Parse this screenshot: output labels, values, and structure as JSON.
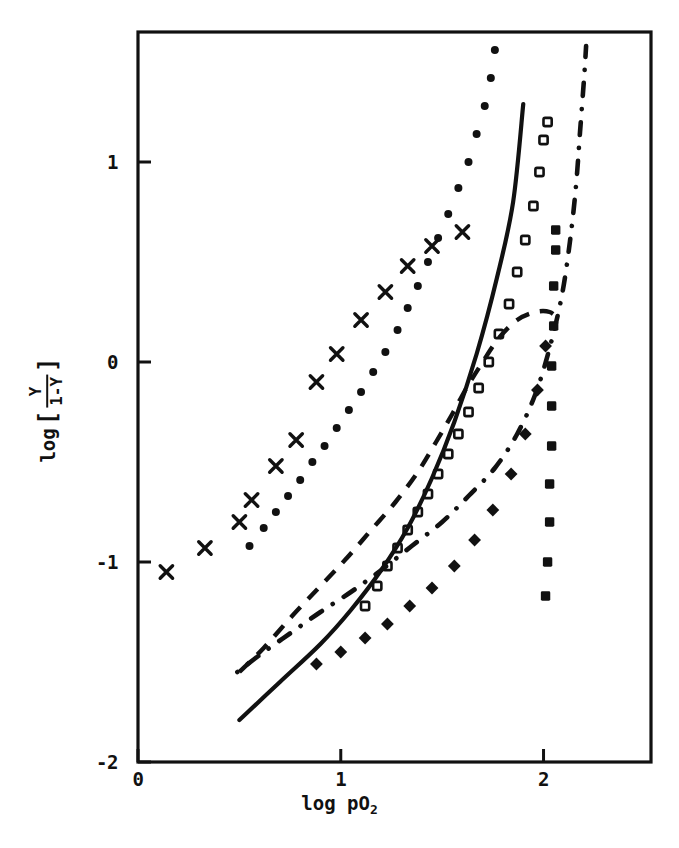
{
  "chart_data": {
    "type": "scatter",
    "title": "",
    "subtitle": "",
    "xlabel": "log pO2",
    "xlabel_base": "log pO",
    "xlabel_sub": "2",
    "ylabel": "log [ Y / (1-Y) ]",
    "ylabel_prefix": "log",
    "ylabel_numerator": "Y",
    "ylabel_denominator": "1-Y",
    "ylabel_open_bracket": "[",
    "ylabel_close_bracket": "]",
    "xlim": [
      0,
      2.53
    ],
    "ylim": [
      -2,
      1.65
    ],
    "xticks": [
      0,
      1,
      2
    ],
    "xtick_labels": [
      "0",
      "1",
      "2"
    ],
    "yticks": [
      -2,
      -1,
      0,
      1
    ],
    "ytick_labels": [
      "-2",
      "-1",
      "0",
      "1"
    ],
    "grid": false,
    "legend": "none",
    "axis_color": "#111111",
    "series": [
      {
        "name": "x-markers",
        "marker": "x",
        "style": "markers",
        "color": "#111111",
        "points": [
          [
            0.14,
            -1.05
          ],
          [
            0.33,
            -0.93
          ],
          [
            0.5,
            -0.8
          ],
          [
            0.56,
            -0.69
          ],
          [
            0.68,
            -0.52
          ],
          [
            0.78,
            -0.39
          ],
          [
            0.88,
            -0.1
          ],
          [
            0.98,
            0.04
          ],
          [
            1.1,
            0.21
          ],
          [
            1.22,
            0.35
          ],
          [
            1.33,
            0.48
          ],
          [
            1.45,
            0.58
          ],
          [
            1.6,
            0.65
          ]
        ]
      },
      {
        "name": "dotted-filled-circles",
        "marker": "circle-filled",
        "style": "dotted-line",
        "color": "#111111",
        "points": [
          [
            0.55,
            -0.92
          ],
          [
            0.62,
            -0.83
          ],
          [
            0.68,
            -0.75
          ],
          [
            0.74,
            -0.67
          ],
          [
            0.8,
            -0.59
          ],
          [
            0.86,
            -0.5
          ],
          [
            0.92,
            -0.42
          ],
          [
            0.98,
            -0.33
          ],
          [
            1.04,
            -0.24
          ],
          [
            1.1,
            -0.15
          ],
          [
            1.16,
            -0.05
          ],
          [
            1.22,
            0.05
          ],
          [
            1.28,
            0.16
          ],
          [
            1.33,
            0.27
          ],
          [
            1.38,
            0.38
          ],
          [
            1.43,
            0.5
          ],
          [
            1.48,
            0.62
          ],
          [
            1.53,
            0.74
          ],
          [
            1.58,
            0.87
          ],
          [
            1.63,
            1.0
          ],
          [
            1.67,
            1.14
          ],
          [
            1.71,
            1.28
          ],
          [
            1.74,
            1.42
          ],
          [
            1.76,
            1.56
          ]
        ]
      },
      {
        "name": "solid-line",
        "marker": "none",
        "style": "solid-line",
        "color": "#111111",
        "points": [
          [
            0.5,
            -1.79
          ],
          [
            0.7,
            -1.6
          ],
          [
            0.9,
            -1.41
          ],
          [
            1.05,
            -1.24
          ],
          [
            1.2,
            -1.04
          ],
          [
            1.33,
            -0.83
          ],
          [
            1.45,
            -0.58
          ],
          [
            1.56,
            -0.3
          ],
          [
            1.67,
            0.04
          ],
          [
            1.77,
            0.42
          ],
          [
            1.85,
            0.8
          ],
          [
            1.9,
            1.29
          ]
        ]
      },
      {
        "name": "open-squares",
        "marker": "square-open",
        "style": "markers",
        "color": "#111111",
        "points": [
          [
            1.12,
            -1.22
          ],
          [
            1.18,
            -1.12
          ],
          [
            1.23,
            -1.02
          ],
          [
            1.28,
            -0.93
          ],
          [
            1.33,
            -0.84
          ],
          [
            1.38,
            -0.75
          ],
          [
            1.43,
            -0.66
          ],
          [
            1.48,
            -0.56
          ],
          [
            1.53,
            -0.46
          ],
          [
            1.58,
            -0.36
          ],
          [
            1.63,
            -0.25
          ],
          [
            1.68,
            -0.13
          ],
          [
            1.73,
            0.0
          ],
          [
            1.78,
            0.14
          ],
          [
            1.83,
            0.29
          ],
          [
            1.87,
            0.45
          ],
          [
            1.91,
            0.61
          ],
          [
            1.95,
            0.78
          ],
          [
            1.98,
            0.95
          ],
          [
            2.0,
            1.11
          ],
          [
            2.02,
            1.2
          ]
        ]
      },
      {
        "name": "dashed-line",
        "marker": "none",
        "style": "dashed-line",
        "color": "#111111",
        "points": [
          [
            0.5,
            -1.55
          ],
          [
            0.62,
            -1.43
          ],
          [
            0.76,
            -1.27
          ],
          [
            0.9,
            -1.12
          ],
          [
            1.03,
            -0.98
          ],
          [
            1.15,
            -0.84
          ],
          [
            1.27,
            -0.7
          ],
          [
            1.38,
            -0.55
          ],
          [
            1.47,
            -0.4
          ],
          [
            1.55,
            -0.26
          ],
          [
            1.62,
            -0.13
          ],
          [
            1.7,
            0.0
          ],
          [
            1.78,
            0.12
          ],
          [
            1.87,
            0.21
          ],
          [
            1.96,
            0.25
          ],
          [
            2.03,
            0.25
          ],
          [
            2.08,
            0.21
          ]
        ]
      },
      {
        "name": "dash-dot-line",
        "marker": "none",
        "style": "dash-dot-line",
        "color": "#111111",
        "points": [
          [
            0.49,
            -1.55
          ],
          [
            0.62,
            -1.45
          ],
          [
            0.76,
            -1.35
          ],
          [
            0.9,
            -1.25
          ],
          [
            1.05,
            -1.15
          ],
          [
            1.2,
            -1.04
          ],
          [
            1.35,
            -0.92
          ],
          [
            1.5,
            -0.8
          ],
          [
            1.63,
            -0.67
          ],
          [
            1.76,
            -0.53
          ],
          [
            1.87,
            -0.36
          ],
          [
            1.96,
            -0.16
          ],
          [
            2.03,
            0.07
          ],
          [
            2.09,
            0.33
          ],
          [
            2.13,
            0.6
          ],
          [
            2.16,
            0.88
          ],
          [
            2.18,
            1.15
          ],
          [
            2.2,
            1.42
          ],
          [
            2.21,
            1.58
          ]
        ]
      },
      {
        "name": "filled-squares-steep",
        "marker": "square-filled",
        "style": "markers",
        "color": "#111111",
        "points": [
          [
            2.01,
            -1.17
          ],
          [
            2.02,
            -1.0
          ],
          [
            2.03,
            -0.8
          ],
          [
            2.03,
            -0.61
          ],
          [
            2.04,
            -0.42
          ],
          [
            2.04,
            -0.22
          ],
          [
            2.04,
            -0.02
          ],
          [
            2.05,
            0.18
          ],
          [
            2.05,
            0.38
          ],
          [
            2.06,
            0.56
          ],
          [
            2.06,
            0.66
          ]
        ]
      },
      {
        "name": "filled-diamonds-lower",
        "marker": "diamond-filled",
        "style": "markers",
        "color": "#111111",
        "points": [
          [
            0.88,
            -1.51
          ],
          [
            1.0,
            -1.45
          ],
          [
            1.12,
            -1.38
          ],
          [
            1.23,
            -1.31
          ],
          [
            1.34,
            -1.22
          ],
          [
            1.45,
            -1.13
          ],
          [
            1.56,
            -1.02
          ],
          [
            1.66,
            -0.89
          ],
          [
            1.75,
            -0.74
          ],
          [
            1.84,
            -0.56
          ],
          [
            1.91,
            -0.36
          ],
          [
            1.97,
            -0.14
          ],
          [
            2.01,
            0.08
          ]
        ]
      }
    ]
  },
  "axes": {
    "plot_left_px": 138,
    "plot_right_px": 651,
    "plot_top_px": 32,
    "plot_bottom_px": 762
  }
}
